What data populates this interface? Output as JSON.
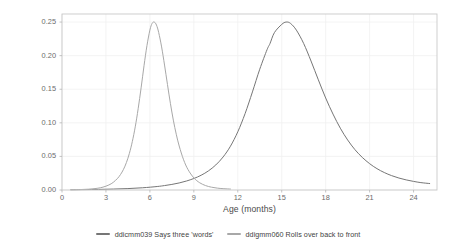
{
  "chart_data": {
    "type": "line",
    "title": "",
    "xlabel": "Age (months)",
    "ylabel": "Item information",
    "xlim": [
      0,
      25.6
    ],
    "ylim": [
      0,
      0.262
    ],
    "xticks": [
      0,
      3,
      6,
      9,
      12,
      15,
      18,
      21,
      24
    ],
    "yticks": [
      0.0,
      0.05,
      0.1,
      0.15,
      0.2,
      0.25
    ],
    "ytick_labels": [
      "0.00",
      "0.05",
      "0.10",
      "0.15",
      "0.20",
      "0.25"
    ],
    "xtick_labels": [
      "0",
      "3",
      "6",
      "9",
      "12",
      "15",
      "18",
      "21",
      "24"
    ],
    "grid": true,
    "legend_position": "bottom",
    "series": [
      {
        "name": "ddicmm039 Says three 'words'",
        "color": "#767676",
        "peak_x": 14.2,
        "peak_y": 0.25,
        "x_start": 0.6,
        "x_end": 25.1,
        "points": [
          [
            0.6,
            0.0004
          ],
          [
            1.5,
            0.0006
          ],
          [
            2.5,
            0.0009
          ],
          [
            3.5,
            0.0014
          ],
          [
            4.5,
            0.0021
          ],
          [
            5.5,
            0.0033
          ],
          [
            6.5,
            0.0052
          ],
          [
            7.0,
            0.0066
          ],
          [
            7.5,
            0.0083
          ],
          [
            8.0,
            0.0105
          ],
          [
            8.5,
            0.0134
          ],
          [
            9.0,
            0.0171
          ],
          [
            9.5,
            0.022
          ],
          [
            10.0,
            0.0285
          ],
          [
            10.5,
            0.0373
          ],
          [
            11.0,
            0.0492
          ],
          [
            11.5,
            0.0652
          ],
          [
            12.0,
            0.0866
          ],
          [
            12.5,
            0.1138
          ],
          [
            13.0,
            0.146
          ],
          [
            13.5,
            0.1798
          ],
          [
            14.0,
            0.209
          ],
          [
            14.2,
            0.218
          ],
          [
            14.5,
            0.2343
          ],
          [
            15.0,
            0.2465
          ],
          [
            15.3,
            0.25
          ],
          [
            15.6,
            0.248
          ],
          [
            16.0,
            0.238
          ],
          [
            16.5,
            0.218
          ],
          [
            17.0,
            0.192
          ],
          [
            17.5,
            0.164
          ],
          [
            18.0,
            0.137
          ],
          [
            18.5,
            0.113
          ],
          [
            19.0,
            0.092
          ],
          [
            19.5,
            0.0745
          ],
          [
            20.0,
            0.06
          ],
          [
            20.5,
            0.0485
          ],
          [
            21.0,
            0.0392
          ],
          [
            21.5,
            0.0318
          ],
          [
            22.0,
            0.026
          ],
          [
            22.5,
            0.0214
          ],
          [
            23.0,
            0.0178
          ],
          [
            23.5,
            0.015
          ],
          [
            24.0,
            0.0128
          ],
          [
            24.5,
            0.011
          ],
          [
            25.1,
            0.0096
          ]
        ]
      },
      {
        "name": "ddigmm060 Rolls over back to front",
        "color": "#a8a8a8",
        "peak_x": 5.7,
        "peak_y": 0.25,
        "x_start": 0.6,
        "x_end": 11.5,
        "points": [
          [
            0.6,
            0.0003
          ],
          [
            1.2,
            0.0006
          ],
          [
            1.8,
            0.0012
          ],
          [
            2.4,
            0.0025
          ],
          [
            2.8,
            0.0043
          ],
          [
            3.2,
            0.0075
          ],
          [
            3.5,
            0.0114
          ],
          [
            3.8,
            0.0175
          ],
          [
            4.0,
            0.0232
          ],
          [
            4.2,
            0.0308
          ],
          [
            4.4,
            0.041
          ],
          [
            4.6,
            0.0545
          ],
          [
            4.8,
            0.072
          ],
          [
            5.0,
            0.094
          ],
          [
            5.2,
            0.121
          ],
          [
            5.4,
            0.152
          ],
          [
            5.6,
            0.185
          ],
          [
            5.8,
            0.215
          ],
          [
            6.0,
            0.238
          ],
          [
            6.15,
            0.248
          ],
          [
            6.3,
            0.25
          ],
          [
            6.45,
            0.2455
          ],
          [
            6.6,
            0.2345
          ],
          [
            6.8,
            0.213
          ],
          [
            7.0,
            0.186
          ],
          [
            7.2,
            0.157
          ],
          [
            7.4,
            0.129
          ],
          [
            7.6,
            0.104
          ],
          [
            7.8,
            0.083
          ],
          [
            8.0,
            0.0655
          ],
          [
            8.3,
            0.045
          ],
          [
            8.6,
            0.0305
          ],
          [
            9.0,
            0.018
          ],
          [
            9.4,
            0.0108
          ],
          [
            9.8,
            0.0066
          ],
          [
            10.2,
            0.0042
          ],
          [
            10.6,
            0.0028
          ],
          [
            11.0,
            0.002
          ],
          [
            11.5,
            0.0014
          ]
        ]
      }
    ]
  },
  "legend": {
    "items": [
      {
        "label": "ddicmm039 Says three 'words'",
        "color": "#767676"
      },
      {
        "label": "ddigmm060 Rolls over back to front",
        "color": "#a8a8a8"
      }
    ]
  },
  "panel": {
    "background": "#ffffff",
    "border_color": "#c9c9c9",
    "grid_color": "#f0f0f0"
  }
}
